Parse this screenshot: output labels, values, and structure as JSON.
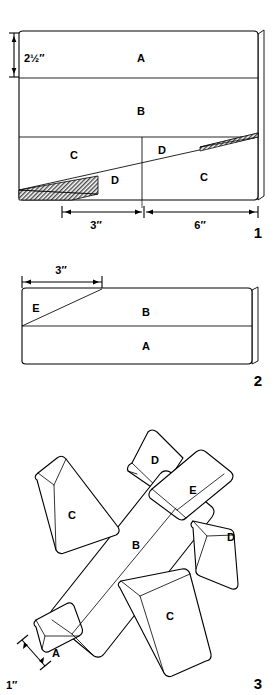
{
  "document": {
    "type": "woodworking-cut-diagram",
    "title": "Toy Airplane Cutting Plan",
    "ink_color": "#000000",
    "paper_color": "#ffffff",
    "hatch_color": "#555555"
  },
  "figures": [
    {
      "number": "1",
      "name": "block-layout-side-view",
      "parts": [
        {
          "label": "A",
          "x": 141,
          "y": 58
        },
        {
          "label": "B",
          "x": 141,
          "y": 111
        },
        {
          "label": "C",
          "x": 74,
          "y": 155
        },
        {
          "label": "D",
          "x": 162,
          "y": 150
        },
        {
          "label": "D",
          "x": 115,
          "y": 180
        },
        {
          "label": "C",
          "x": 204,
          "y": 177
        }
      ],
      "dimensions": [
        {
          "name": "height-dimension",
          "value": "2½″",
          "x": 24,
          "y": 43
        },
        {
          "name": "width-dimension-left",
          "value": "3″",
          "x": 96,
          "y": 224
        },
        {
          "name": "width-dimension-right",
          "value": "6″",
          "x": 200,
          "y": 224
        }
      ]
    },
    {
      "number": "2",
      "name": "block-layout-top-view",
      "parts": [
        {
          "label": "E",
          "x": 36,
          "y": 308
        },
        {
          "label": "B",
          "x": 146,
          "y": 312
        },
        {
          "label": "A",
          "x": 146,
          "y": 350
        }
      ],
      "dimensions": [
        {
          "name": "width-dimension",
          "value": "3″",
          "x": 61,
          "y": 277
        }
      ]
    },
    {
      "number": "3",
      "name": "assembled-airplane-view",
      "parts": [
        {
          "label": "D",
          "x": 155,
          "y": 460
        },
        {
          "label": "E",
          "x": 193,
          "y": 490
        },
        {
          "label": "C",
          "x": 72,
          "y": 515
        },
        {
          "label": "B",
          "x": 136,
          "y": 545
        },
        {
          "label": "D",
          "x": 231,
          "y": 537
        },
        {
          "label": "C",
          "x": 170,
          "y": 616
        },
        {
          "label": "A",
          "x": 56,
          "y": 653
        }
      ],
      "dimensions": [
        {
          "name": "nose-thickness-dimension",
          "value": "1″",
          "x": 16,
          "y": 685
        }
      ]
    }
  ]
}
